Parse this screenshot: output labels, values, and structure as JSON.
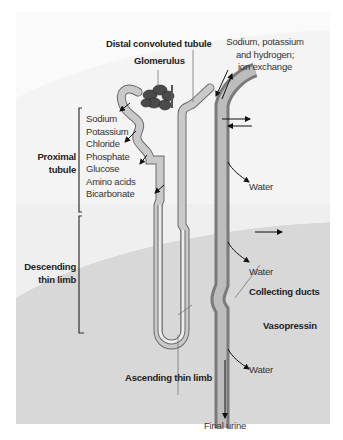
{
  "figure": {
    "colors": {
      "background_upper": "#f3f3f3",
      "background_lower": "#d9d9d9",
      "tubule_fill": "#c8c8c8",
      "tubule_outline": "#6b6b6b",
      "collecting_duct_wall": "#7a7a7a",
      "collecting_duct_lumen": "#bdbdbd",
      "glomerulus": "#4a4a4a",
      "text": "#333333"
    }
  },
  "labels": {
    "distal_convoluted_tubule": "Distal convoluted tubule",
    "glomerulus": "Glomerulus",
    "ion_exchange_line1": "Sodium, potassium",
    "ion_exchange_line2": "and hydrogen;",
    "ion_exchange_line3": "ion exchange",
    "proximal_tubule_line1": "Proximal",
    "proximal_tubule_line2": "tubule",
    "descending_line1": "Descending",
    "descending_line2": "thin limb",
    "ascending_thin_limb": "Ascending thin limb",
    "collecting_ducts": "Collecting ducts",
    "vasopressin": "Vasopressin",
    "water_1": "Water",
    "water_2": "Water",
    "water_3": "Water",
    "final_urine": "Final urine"
  },
  "reabsorbed_substances": [
    "Sodium",
    "Potassium",
    "Chloride",
    "Phosphate",
    "Glucose",
    "Amino acids",
    "Bicarbonate"
  ]
}
